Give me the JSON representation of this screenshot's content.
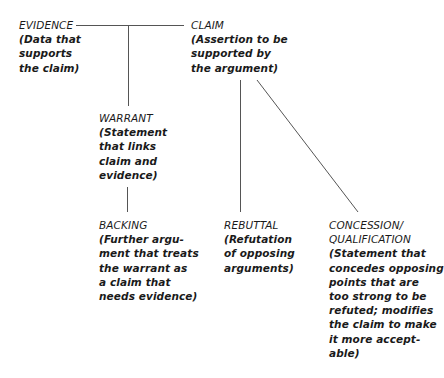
{
  "diagram": {
    "type": "toulmin-argument-model",
    "nodes": {
      "evidence": {
        "title": "EVIDENCE",
        "description": "(Data that\nsupports\nthe claim)"
      },
      "claim": {
        "title": "CLAIM",
        "description": "(Assertion to be\nsupported by\nthe argument)"
      },
      "warrant": {
        "title": "WARRANT",
        "description": "(Statement\nthat links\nclaim and\nevidence)"
      },
      "backing": {
        "title": "BACKING",
        "description": "(Further argu-\nment that treats\nthe warrant as\na claim that\nneeds evidence)"
      },
      "rebuttal": {
        "title": "REBUTTAL",
        "description": "(Refutation\nof opposing\narguments)"
      },
      "concession": {
        "title": "CONCESSION/",
        "title2": "QUALIFICATION",
        "description": "(Statement that\nconcedes opposing\npoints that are\ntoo strong to be\nrefuted; modifies\nthe claim to make\nit more accept-\nable)"
      }
    },
    "edges": [
      {
        "from": "evidence",
        "to": "claim"
      },
      {
        "from": "evidence-claim-link",
        "to": "warrant"
      },
      {
        "from": "warrant",
        "to": "backing"
      },
      {
        "from": "claim",
        "to": "rebuttal"
      },
      {
        "from": "claim",
        "to": "concession"
      }
    ],
    "colors": {
      "text": "#1a1a1a",
      "line": "#555555",
      "background": "#ffffff"
    }
  }
}
